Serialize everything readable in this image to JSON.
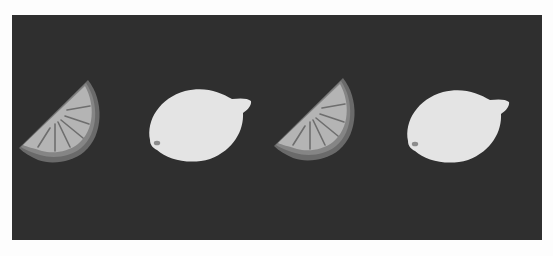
{
  "scene": {
    "description": "Illustration of lemon wedges and whole lemons on a dark background",
    "background_color": "#2f2f2f",
    "page_color": "#fdfdfd",
    "items": [
      {
        "type": "lemon-wedge",
        "label": "Lemon wedge"
      },
      {
        "type": "whole-lemon",
        "label": "Whole lemon"
      },
      {
        "type": "lemon-wedge",
        "label": "Lemon wedge"
      },
      {
        "type": "whole-lemon",
        "label": "Whole lemon"
      }
    ],
    "colors": {
      "rind_outer": "#6a6a6a",
      "rind_inner": "#8a8a8a",
      "pulp": "#b4b4b4",
      "segment_lines": "#6e6e6e",
      "lemon_body": "#e6e6e6",
      "lemon_tip": "#8c8c8c"
    }
  }
}
